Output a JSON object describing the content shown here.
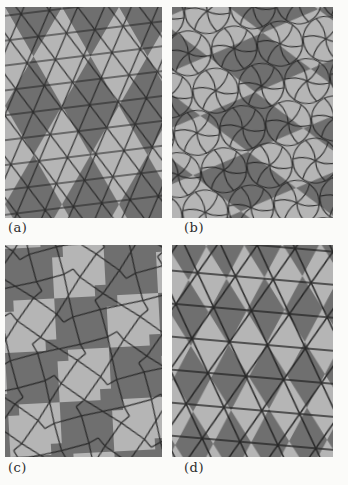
{
  "figure": {
    "panels": [
      {
        "label": "(a)",
        "pattern": "fine-triangular-mesh-over-large-two-tone-triangle-tiling"
      },
      {
        "label": "(b)",
        "pattern": "curved-flower-pentagon-mesh-over-large-two-tone-triangle-tiling"
      },
      {
        "label": "(c)",
        "pattern": "square-and-triangle-mesh-over-two-tone-checkerboard-tiling"
      },
      {
        "label": "(d)",
        "pattern": "coarse-triangular-mesh-over-fine-two-tone-triangle-tiling"
      }
    ],
    "colors": {
      "dark_tile": "#6f6f6f",
      "light_tile": "#b5b5b5",
      "mesh_line": "#1f1f1f",
      "page_background": "#fbfbf9",
      "label_text": "#2b2b2b"
    }
  }
}
